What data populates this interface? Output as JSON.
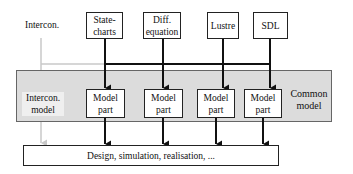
{
  "diagram": {
    "top_label": "Intercon.",
    "sources": [
      {
        "id": "statecharts",
        "line1": "State-",
        "line2": "charts"
      },
      {
        "id": "diff-equation",
        "line1": "Diff.",
        "line2": "equation"
      },
      {
        "id": "lustre",
        "line1": "Lustre",
        "line2": ""
      },
      {
        "id": "sdl",
        "line1": "SDL",
        "line2": ""
      }
    ],
    "common_model": {
      "label_line1": "Common",
      "label_line2": "model",
      "intercon_line1": "Intercon.",
      "intercon_line2": "model",
      "parts": [
        {
          "line1": "Model",
          "line2": "part"
        },
        {
          "line1": "Model",
          "line2": "part"
        },
        {
          "line1": "Model",
          "line2": "part"
        },
        {
          "line1": "Model",
          "line2": "part"
        }
      ]
    },
    "target": "Design, simulation, realisation, ...",
    "colors": {
      "gray_region": "#dcdcdc",
      "gray_arrow": "#c8c8c8",
      "line": "#111111"
    }
  }
}
